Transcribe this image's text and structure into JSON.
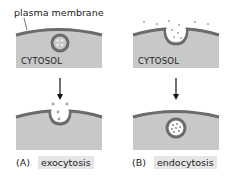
{
  "labels": {
    "plasma_membrane": "plasma membrane",
    "cytosol_a": "CYTOSOL",
    "cytosol_b": "CYTOSOL"
  },
  "panels": [
    {
      "letter": "(A)",
      "name": "exocytosis"
    },
    {
      "letter": "(B)",
      "name": "endocytosis"
    }
  ],
  "colors": {
    "membrane": "#6b6b6b",
    "cytosol": "#c8c8c8",
    "vesicle_fill": "#c8c8c8",
    "cargo": "#a0a0a0",
    "arrow": "#111111"
  }
}
